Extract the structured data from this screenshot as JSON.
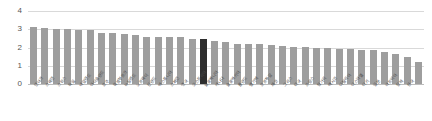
{
  "chart_data": {
    "type": "bar",
    "title": "",
    "xlabel": "",
    "ylabel": "",
    "ylim": [
      0,
      4
    ],
    "yticks": [
      0,
      1,
      2,
      3,
      4
    ],
    "grid": true,
    "legend": false,
    "highlight_index": 15,
    "highlight_color": "#2e2e2e",
    "bar_color": "#9e9e9e",
    "categories": [
      "덴마크",
      "스웨덴",
      "스위스",
      "독일",
      "네덜란드",
      "아이슬란드",
      "호주",
      "룩셈부르크",
      "뉴질랜드",
      "노르웨이",
      "핀란드",
      "에스토니아",
      "스페인",
      "영국",
      "오스트리아",
      "슬로베니아",
      "캐나다",
      "슬로바키아",
      "폴란드",
      "벨기에",
      "포르투갈",
      "체코",
      "그리스",
      "미국",
      "프랑스",
      "헝가리",
      "멕시코",
      "이탈리아",
      "이스라엘",
      "터키",
      "일본",
      "라트비아",
      "칠레",
      "한국"
    ],
    "values": [
      3.12,
      3.05,
      3.04,
      2.99,
      2.98,
      2.98,
      2.8,
      2.79,
      2.76,
      2.71,
      2.6,
      2.55,
      2.57,
      2.57,
      2.45,
      2.45,
      2.36,
      2.3,
      2.2,
      2.21,
      2.19,
      2.13,
      2.1,
      2.04,
      2.01,
      1.97,
      1.95,
      1.94,
      1.9,
      1.89,
      1.88,
      1.75,
      1.67,
      1.49
    ],
    "values_tail": [
      1.18
    ]
  }
}
